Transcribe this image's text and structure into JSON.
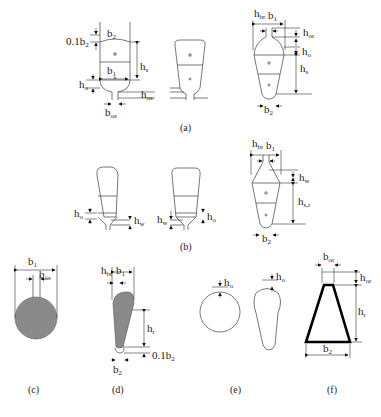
{
  "figure": {
    "panels": [
      {
        "id": "a",
        "label": "(a)",
        "dimensions": [
          "0.1b2",
          "b2",
          "b1",
          "hs",
          "ho",
          "hos",
          "bos"
        ]
      },
      {
        "id": "b",
        "label": "(b)",
        "dimensions": [
          "ho",
          "hw",
          "hw",
          "ho",
          "hbr",
          "b1",
          "hw",
          "hs,r",
          "b2"
        ]
      },
      {
        "id": "c",
        "label": "(c)",
        "dimensions": [
          "b1",
          "bos"
        ]
      },
      {
        "id": "d",
        "label": "(d)",
        "dimensions": [
          "hbr",
          "b1",
          "hr",
          "0.1b2",
          "b2"
        ]
      },
      {
        "id": "e",
        "label": "(e)",
        "dimensions": [
          "ho",
          "ho"
        ]
      },
      {
        "id": "f",
        "label": "(f)",
        "dimensions": [
          "bor",
          "hor",
          "hr",
          "b2"
        ]
      }
    ],
    "labels": {
      "a_01b2": "0.1b",
      "a_b2": "b",
      "a_b1": "b",
      "a_hs": "h",
      "a_ho": "h",
      "a_hos": "h",
      "a_bos": "b",
      "r_hbr": "h",
      "r_b1": "b",
      "r_hor": "h",
      "r_ho": "h",
      "r_hs": "h",
      "r_b2": "b",
      "b_ho1": "h",
      "b_hw1": "h",
      "b_hw2": "h",
      "b_ho2": "h",
      "br_hbr": "h",
      "br_b1": "b",
      "br_hw": "h",
      "br_hsr": "h",
      "br_b2": "b",
      "c_b1": "b",
      "c_bos": "b",
      "d_hbr": "h",
      "d_b1": "b",
      "d_hr": "h",
      "d_01b2": "0.1b",
      "d_b2": "b",
      "e_ho1": "h",
      "e_ho2": "h",
      "f_bor": "b",
      "f_hor": "h",
      "f_hr": "h",
      "f_b2": "b"
    },
    "subs": {
      "two": "2",
      "one": "1",
      "s": "s",
      "o": "o",
      "os": "os",
      "br": "br",
      "or": "or",
      "w": "w",
      "sr": "s,r",
      "r": "r"
    },
    "captions": {
      "a": "(a)",
      "b": "(b)",
      "c": "(c)",
      "d": "(d)",
      "e": "(e)",
      "f": "(f)"
    },
    "colors": {
      "fill_gray": "#8a8a8a",
      "line": "#555555",
      "bold_line": "#000000"
    }
  }
}
